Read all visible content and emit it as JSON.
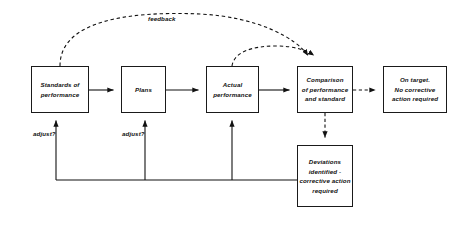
{
  "diagram": {
    "background_color": "#ffffff",
    "stroke_color": "#1a1a1a",
    "nodes": [
      {
        "id": "standards",
        "lines": [
          "Standards of",
          "performance"
        ],
        "x": 31,
        "y": 66,
        "w": 58,
        "h": 47
      },
      {
        "id": "plans",
        "lines": [
          "Plans"
        ],
        "x": 121,
        "y": 66,
        "w": 45,
        "h": 47
      },
      {
        "id": "actual-performance",
        "lines": [
          "Actual",
          "performance"
        ],
        "x": 206,
        "y": 66,
        "w": 53,
        "h": 47
      },
      {
        "id": "comparison",
        "lines": [
          "Comparison",
          "of performance",
          "and standard"
        ],
        "x": 297,
        "y": 66,
        "w": 56,
        "h": 47
      },
      {
        "id": "on-target",
        "lines": [
          "On target.",
          "No corrective",
          "action required"
        ],
        "x": 383,
        "y": 66,
        "w": 64,
        "h": 47
      },
      {
        "id": "deviations",
        "lines": [
          "Deviations",
          "identified -",
          "corrective action",
          "required"
        ],
        "x": 297,
        "y": 145,
        "w": 56,
        "h": 62
      }
    ],
    "edge_labels": [
      {
        "id": "feedback",
        "text": "feedback",
        "x": 148,
        "y": 15
      },
      {
        "id": "adjust-standards",
        "text": "adjust?",
        "x": 33,
        "y": 130
      },
      {
        "id": "adjust-plans",
        "text": "adjust?",
        "x": 122,
        "y": 130
      }
    ]
  }
}
